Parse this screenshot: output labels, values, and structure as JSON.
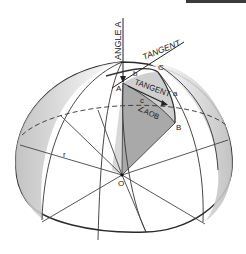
{
  "diagram": {
    "labels": {
      "angle_a": "ANGLE A",
      "tangent_top": "TANGENT",
      "tangent_inner": "TANGENT",
      "vertex_a": "A",
      "vertex_b": "B",
      "vertex_c": "C",
      "side_a": "a",
      "side_b": "b",
      "side_c": "c",
      "central_angle": "∠AOB",
      "radius": "r",
      "center": "O"
    },
    "colors": {
      "line": "#2a2a2a",
      "shade_dark": "#9a9a9a",
      "shade_light": "#cfcfcf",
      "background": "#ffffff"
    }
  }
}
